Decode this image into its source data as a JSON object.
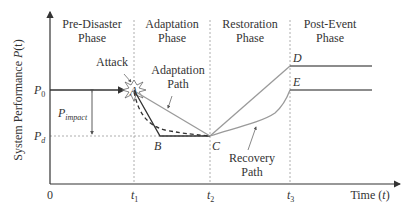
{
  "figure": {
    "y_axis_label": "System Performance P(t)",
    "y_axis_label_prefix": "System Performance ",
    "y_axis_label_var": "P",
    "y_axis_label_arg": "(t)",
    "x_axis_label_prefix": "Time (",
    "x_axis_label_var": "t",
    "x_axis_label_suffix": ")",
    "origin_label": "0",
    "phases": [
      {
        "line1": "Pre-Disaster",
        "line2": "Phase"
      },
      {
        "line1": "Adaptation",
        "line2": "Phase"
      },
      {
        "line1": "Restoration",
        "line2": "Phase"
      },
      {
        "line1": "Post-Event",
        "line2": "Phase"
      }
    ],
    "time_ticks": [
      {
        "base": "t",
        "sub": "1"
      },
      {
        "base": "t",
        "sub": "2"
      },
      {
        "base": "t",
        "sub": "3"
      }
    ],
    "levels": {
      "p0": {
        "base": "P",
        "sub": "0"
      },
      "pd": {
        "base": "P",
        "sub": "d"
      },
      "impact": {
        "base": "P",
        "sub": "impact"
      }
    },
    "points": {
      "A": "A",
      "B": "B",
      "C": "C",
      "D": "D",
      "E": "E"
    },
    "annotations": {
      "attack": "Attack",
      "adaptation_path_1": "Adaptation",
      "adaptation_path_2": "Path",
      "recovery_path_1": "Recovery",
      "recovery_path_2": "Path"
    },
    "colors": {
      "axis": "#333333",
      "dark_line": "#333333",
      "gray_line": "#9a9a9a",
      "dashed_grid": "#999999"
    }
  }
}
